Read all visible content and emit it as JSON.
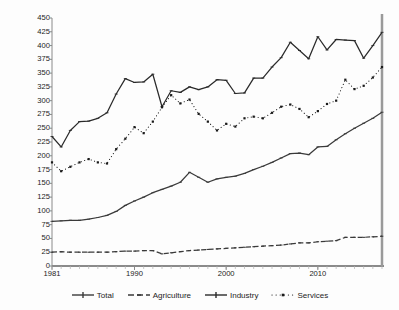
{
  "chart_data": {
    "type": "line",
    "title": "",
    "xlabel": "",
    "ylabel": "Real VA/worker",
    "ylim": [
      0,
      450
    ],
    "ytick_step": 25,
    "yticks": [
      0,
      25,
      50,
      75,
      100,
      125,
      150,
      175,
      200,
      225,
      250,
      275,
      300,
      325,
      350,
      375,
      400,
      425,
      450
    ],
    "xlim": [
      1981,
      2017
    ],
    "xticks": [
      1981,
      1990,
      2000,
      2010
    ],
    "xtick_labels": [
      "1981",
      "1990",
      "2000",
      "2010"
    ],
    "grid": false,
    "legend_position": "bottom",
    "x": [
      1981,
      1982,
      1983,
      1984,
      1985,
      1986,
      1987,
      1988,
      1989,
      1990,
      1991,
      1992,
      1993,
      1994,
      1995,
      1996,
      1997,
      1998,
      1999,
      2000,
      2001,
      2002,
      2003,
      2004,
      2005,
      2006,
      2007,
      2008,
      2009,
      2010,
      2011,
      2012,
      2013,
      2014,
      2015,
      2016,
      2017
    ],
    "series": [
      {
        "name": "Total",
        "style": "solid",
        "marker": "plus",
        "color": "#3a3a3a",
        "values": [
          81,
          82,
          83,
          83,
          85,
          88,
          92,
          99,
          110,
          118,
          125,
          133,
          139,
          145,
          152,
          170,
          161,
          152,
          158,
          161,
          163,
          168,
          175,
          181,
          188,
          196,
          204,
          205,
          202,
          216,
          217,
          229,
          240,
          250,
          259,
          268,
          279
        ]
      },
      {
        "name": "Agriculture",
        "style": "dashed",
        "marker": "dash",
        "color": "#3a3a3a",
        "values": [
          25,
          26,
          25,
          25,
          25,
          25,
          25,
          26,
          27,
          27,
          28,
          28,
          22,
          24,
          26,
          28,
          29,
          30,
          31,
          32,
          33,
          34,
          35,
          36,
          37,
          38,
          40,
          42,
          42,
          44,
          45,
          46,
          52,
          52,
          52,
          53,
          54
        ]
      },
      {
        "name": "Industry",
        "style": "solid",
        "marker": "plus",
        "color": "#2a2a2a",
        "values": [
          235,
          216,
          246,
          262,
          263,
          268,
          278,
          312,
          340,
          333,
          334,
          348,
          289,
          318,
          315,
          325,
          320,
          325,
          338,
          337,
          313,
          314,
          341,
          341,
          361,
          378,
          406,
          391,
          376,
          416,
          392,
          411,
          410,
          409,
          377,
          400,
          424
        ]
      },
      {
        "name": "Services",
        "style": "dotted",
        "marker": "square",
        "color": "#1a1a1a",
        "values": [
          188,
          172,
          180,
          188,
          194,
          188,
          186,
          212,
          231,
          252,
          241,
          262,
          288,
          310,
          295,
          302,
          276,
          262,
          246,
          258,
          253,
          268,
          271,
          268,
          278,
          289,
          293,
          285,
          270,
          281,
          294,
          300,
          338,
          321,
          327,
          342,
          361
        ]
      }
    ]
  },
  "legend": {
    "items": [
      {
        "label": "Total",
        "key": "total"
      },
      {
        "label": "Agriculture",
        "key": "agriculture"
      },
      {
        "label": "Industry",
        "key": "industry"
      },
      {
        "label": "Services",
        "key": "services"
      }
    ]
  },
  "colors": {
    "axis": "#8a8a8a",
    "text": "#1c1c1c",
    "background": "#fdfdfd",
    "line_dark": "#2a2a2a"
  }
}
